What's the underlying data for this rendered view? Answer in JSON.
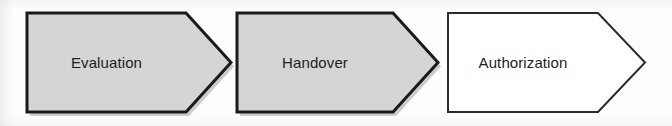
{
  "diagram": {
    "type": "process-flow-chevrons",
    "title": "",
    "orientation": "horizontal",
    "background_color": "#fdfdfd",
    "steps": [
      {
        "id": "evaluation",
        "label": "Evaluation",
        "order": 1,
        "shape": "chevron-arrow",
        "fill_color": "#d5d5d5",
        "border_color": "#1a1a1a",
        "border_width": 3,
        "text_color": "#1d1d1d",
        "has_shadow": true,
        "geometry": {
          "x": 27,
          "y": 13,
          "width": 204,
          "height": 99,
          "notch": 45
        }
      },
      {
        "id": "handover",
        "label": "Handover",
        "order": 2,
        "shape": "chevron-arrow",
        "fill_color": "#d5d5d5",
        "border_color": "#1a1a1a",
        "border_width": 3,
        "text_color": "#1d1d1d",
        "has_shadow": true,
        "geometry": {
          "x": 237,
          "y": 13,
          "width": 201,
          "height": 99,
          "notch": 45
        }
      },
      {
        "id": "authorization",
        "label": "Authorization",
        "order": 3,
        "shape": "chevron-arrow",
        "fill_color": "#ffffff",
        "border_color": "#2b2b2b",
        "border_width": 2,
        "text_color": "#1d1d1d",
        "has_shadow": false,
        "geometry": {
          "x": 448,
          "y": 13,
          "width": 197,
          "height": 99,
          "notch": 47
        }
      }
    ]
  }
}
